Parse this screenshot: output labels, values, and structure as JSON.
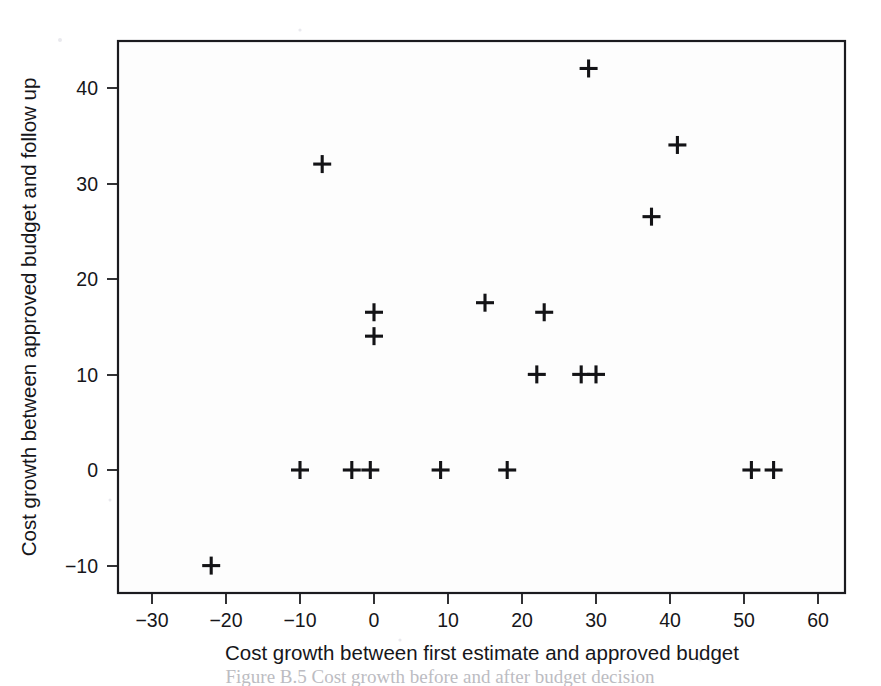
{
  "figure": {
    "name": "scatter-plot-cost-growth",
    "background_color": "#ffffff",
    "marker_color": "#131316",
    "frame_color": "#1b1b1f",
    "caption_partial": "Figure B.5 Cost growth before and after budget decision"
  },
  "chart_data": {
    "type": "scatter",
    "title": "",
    "xlabel": "Cost growth between first estimate and approved budget",
    "ylabel": "Cost growth between approved budget and follow up",
    "xlim": [
      -35,
      65
    ],
    "ylim": [
      -14,
      45
    ],
    "xticks": [
      -30,
      -20,
      -10,
      0,
      10,
      20,
      30,
      40,
      50,
      60
    ],
    "xtick_labels": [
      "−30",
      "−20",
      "−10",
      "0",
      "10",
      "20",
      "30",
      "40",
      "50",
      "60"
    ],
    "yticks": [
      -10,
      0,
      10,
      20,
      30,
      40
    ],
    "ytick_labels": [
      "−10",
      "0",
      "10",
      "20",
      "30",
      "40"
    ],
    "grid": false,
    "legend": null,
    "marker": "plus",
    "points": [
      {
        "x": -22,
        "y": -10
      },
      {
        "x": -10,
        "y": 0
      },
      {
        "x": -3,
        "y": 0
      },
      {
        "x": -0.5,
        "y": 0
      },
      {
        "x": 9,
        "y": 0
      },
      {
        "x": 18,
        "y": 0
      },
      {
        "x": 51,
        "y": 0
      },
      {
        "x": 54,
        "y": 0
      },
      {
        "x": 22,
        "y": 10
      },
      {
        "x": 28,
        "y": 10
      },
      {
        "x": 30,
        "y": 10
      },
      {
        "x": 0,
        "y": 14
      },
      {
        "x": 0,
        "y": 16.5
      },
      {
        "x": 23,
        "y": 16.5
      },
      {
        "x": 15,
        "y": 17.5
      },
      {
        "x": 37.5,
        "y": 26.5
      },
      {
        "x": -7,
        "y": 32
      },
      {
        "x": 41,
        "y": 34
      },
      {
        "x": 29,
        "y": 42
      }
    ]
  }
}
